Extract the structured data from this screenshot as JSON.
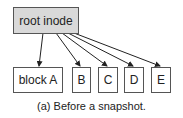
{
  "diagram": {
    "root": {
      "label": "root inode",
      "fill": "#d9d9d9"
    },
    "blocks": [
      {
        "label": "block A"
      },
      {
        "label": "B"
      },
      {
        "label": "C"
      },
      {
        "label": "D"
      },
      {
        "label": "E"
      }
    ],
    "caption": "(a) Before a snapshot."
  }
}
